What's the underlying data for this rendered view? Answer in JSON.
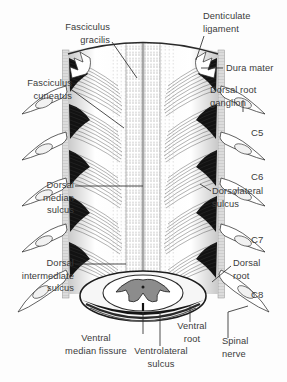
{
  "figure": {
    "background_color": "#fdfdfd",
    "text_color": "#3b3b3b",
    "ink_color": "#1a1a1a"
  },
  "labels": {
    "fasciculus_gracilis": "Fasciculus\ngracilis",
    "fasciculus_gracilis_l1": "Fasciculus",
    "fasciculus_gracilis_l2": "gracilis",
    "denticulate_ligament_l1": "Denticulate",
    "denticulate_ligament_l2": "ligament",
    "fasciculus_cuneatus_l1": "Fasciculus",
    "fasciculus_cuneatus_l2": "cuneatus",
    "dura_mater": "Dura mater",
    "dorsal_root_ganglion_l1": "Dorsal root",
    "dorsal_root_ganglion_l2": "ganglion",
    "dorsal_median_sulcus_l1": "Dorsal",
    "dorsal_median_sulcus_l2": "median",
    "dorsal_median_sulcus_l3": "sulcus",
    "dorsolateral_sulcus_l1": "Dorsolateral",
    "dorsolateral_sulcus_l2": "sulcus",
    "dorsal_intermediate_sulcus_l1": "Dorsal",
    "dorsal_intermediate_sulcus_l2": "intermediate",
    "dorsal_intermediate_sulcus_l3": "sulcus",
    "dorsal_root_l1": "Dorsal",
    "dorsal_root_l2": "root",
    "ventral_median_fissure_l1": "Ventral",
    "ventral_median_fissure_l2": "median fissure",
    "ventrolateral_sulcus_l1": "Ventrolateral",
    "ventrolateral_sulcus_l2": "sulcus",
    "ventral_root_l1": "Ventral",
    "ventral_root_l2": "root",
    "spinal_nerve_l1": "Spinal",
    "spinal_nerve_l2": "nerve"
  },
  "segments": [
    {
      "name": "C5",
      "label": "C5"
    },
    {
      "name": "C6",
      "label": "C6"
    },
    {
      "name": "C7",
      "label": "C7"
    },
    {
      "name": "C8",
      "label": "C8"
    }
  ],
  "caption": {
    "prefix": "Figure",
    "number": "",
    "text": ""
  }
}
